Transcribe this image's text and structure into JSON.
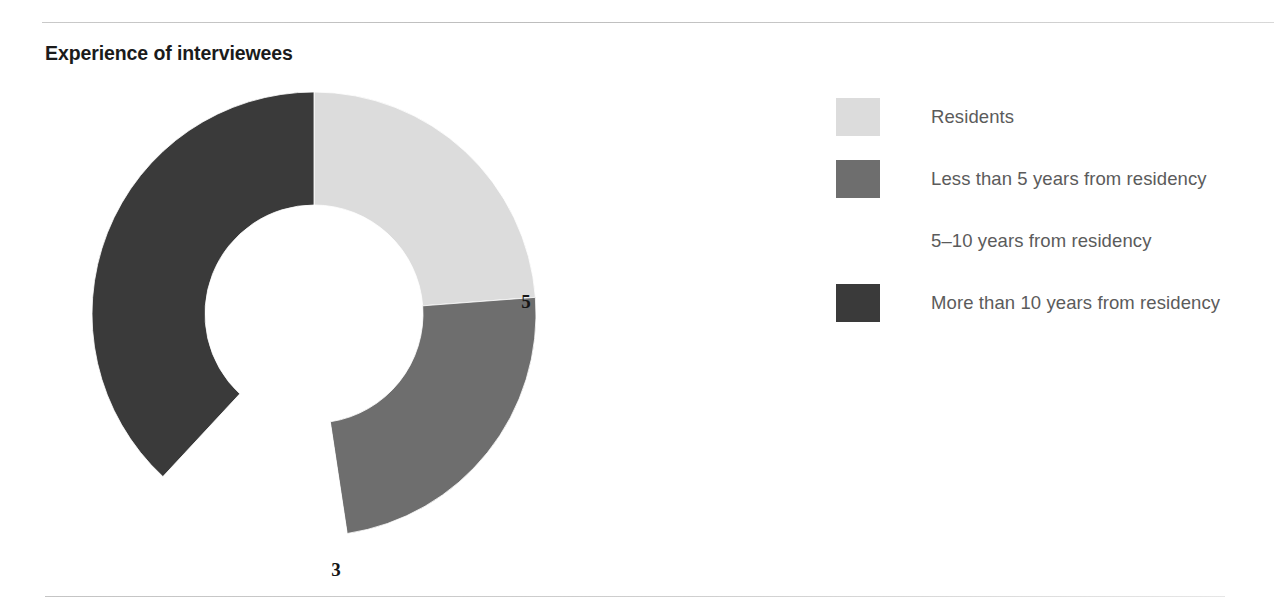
{
  "figure": {
    "title": "Experience of interviewees",
    "background": "#ffffff",
    "rule_color": "#c6c6c6"
  },
  "chart_data": {
    "type": "pie",
    "variant": "donut",
    "title": "Experience of interviewees",
    "xlabel": "",
    "ylabel": "",
    "total": 21,
    "start_angle_deg": 0,
    "direction": "clockwise",
    "inner_radius_px": 109,
    "outer_radius_px": 222,
    "center_px": [
      314,
      314
    ],
    "categories": [
      "Residents",
      "Less than 5 years from residency",
      "5–10 years from residency",
      "More than 10 years from residency"
    ],
    "values": [
      5,
      5,
      3,
      8
    ],
    "colors": [
      "#dcdcdc",
      "#6e6e6e",
      "#ffffff",
      "#3a3a3a"
    ],
    "slices": [
      {
        "label": "Residents",
        "value": 5,
        "value_text": "5",
        "color": "#dcdcdc",
        "label_color": "#161616",
        "start_deg": 0,
        "end_deg": 85.7
      },
      {
        "label": "Less than 5 years from residency",
        "value": 5,
        "value_text": "5",
        "color": "#6e6e6e",
        "label_color": "#ffffff",
        "start_deg": 85.7,
        "end_deg": 171.4
      },
      {
        "label": "5–10 years from residency",
        "value": 3,
        "value_text": "3",
        "color": "#ffffff",
        "label_color": "#161616",
        "start_deg": 171.4,
        "end_deg": 222.9
      },
      {
        "label": "More than 10 years from residency",
        "value": 8,
        "value_text": "8",
        "color": "#3a3a3a",
        "label_color": "#ffffff",
        "start_deg": 222.9,
        "end_deg": 360
      }
    ],
    "legend": {
      "position": "right",
      "entries": [
        {
          "label": "Residents",
          "swatch": "#dcdcdc"
        },
        {
          "label": "Less than 5 years from residency",
          "swatch": "#6e6e6e"
        },
        {
          "label": "5–10 years from residency",
          "swatch": "#ffffff"
        },
        {
          "label": "More than 10 years from residency",
          "swatch": "#3a3a3a"
        }
      ]
    }
  }
}
